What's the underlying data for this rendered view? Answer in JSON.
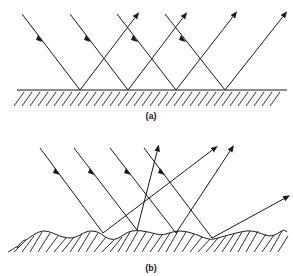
{
  "figure": {
    "panel_a": {
      "label": "(a)",
      "description": "Specular reflection from a smooth surface",
      "surface": "flat"
    },
    "panel_b": {
      "label": "(b)",
      "description": "Diffuse reflection from a rough surface",
      "surface": "wavy"
    },
    "colors": {
      "line": "#1a1a1a",
      "background": "#ffffff"
    }
  }
}
